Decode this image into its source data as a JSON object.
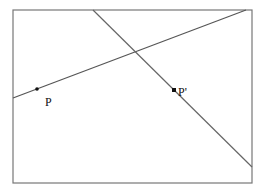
{
  "diagram": {
    "frame": {
      "x": 13,
      "y": 10,
      "width": 239,
      "height": 173,
      "stroke": "#777777"
    },
    "lines": [
      {
        "name": "line-through-p",
        "x1": 13,
        "y1": 98,
        "x2": 246,
        "y2": 10,
        "stroke": "#555555"
      },
      {
        "name": "line-through-p-prime",
        "x1": 93,
        "y1": 10,
        "x2": 252,
        "y2": 167,
        "stroke": "#666666"
      }
    ],
    "points": [
      {
        "name": "point-p",
        "x": 37,
        "y": 89,
        "label": "P",
        "label_x": 45,
        "label_y": 106
      },
      {
        "name": "point-p-prime",
        "x": 174,
        "y": 90,
        "label": "P'",
        "label_x": 178,
        "label_y": 96
      }
    ]
  }
}
